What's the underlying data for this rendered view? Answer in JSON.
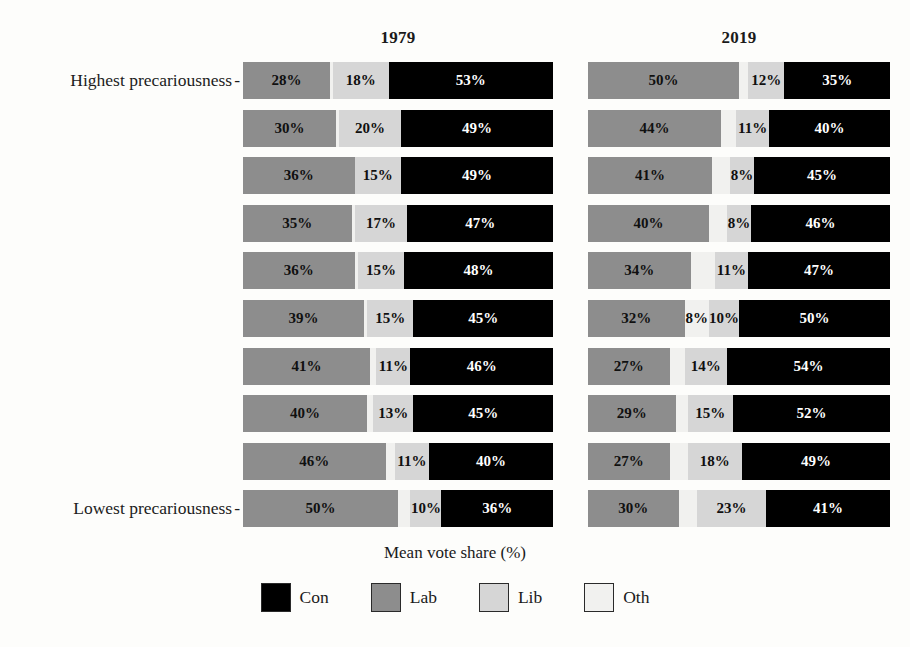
{
  "chart_data": {
    "type": "bar",
    "subtype": "stacked-horizontal",
    "title": "",
    "xlabel": "Mean vote share (%)",
    "ylabel": "",
    "xlim": [
      0,
      100
    ],
    "grid": false,
    "legend_position": "bottom",
    "panels": [
      {
        "label": "1979"
      },
      {
        "label": "2019"
      }
    ],
    "categories": [
      "Highest precariousness",
      "",
      "",
      "",
      "",
      "",
      "",
      "",
      "",
      "Lowest precariousness"
    ],
    "series_order": [
      "Lab",
      "Oth",
      "Lib",
      "Con"
    ],
    "legend": [
      {
        "name": "Con",
        "color": "#000000"
      },
      {
        "name": "Lab",
        "color": "#8d8d8d"
      },
      {
        "name": "Lib",
        "color": "#d6d6d6"
      },
      {
        "name": "Oth",
        "color": "#f1f1ef"
      }
    ],
    "panel_1979": {
      "rows": [
        {
          "Lab": 28,
          "Oth": 1,
          "Lib": 18,
          "Con": 53,
          "labels": {
            "Lab": "28%",
            "Oth": "",
            "Lib": "18%",
            "Con": "53%"
          }
        },
        {
          "Lab": 30,
          "Oth": 1,
          "Lib": 20,
          "Con": 49,
          "labels": {
            "Lab": "30%",
            "Oth": "",
            "Lib": "20%",
            "Con": "49%"
          }
        },
        {
          "Lab": 36,
          "Oth": 0,
          "Lib": 15,
          "Con": 49,
          "labels": {
            "Lab": "36%",
            "Oth": "",
            "Lib": "15%",
            "Con": "49%"
          }
        },
        {
          "Lab": 35,
          "Oth": 1,
          "Lib": 17,
          "Con": 47,
          "labels": {
            "Lab": "35%",
            "Oth": "",
            "Lib": "17%",
            "Con": "47%"
          }
        },
        {
          "Lab": 36,
          "Oth": 1,
          "Lib": 15,
          "Con": 48,
          "labels": {
            "Lab": "36%",
            "Oth": "",
            "Lib": "15%",
            "Con": "48%"
          }
        },
        {
          "Lab": 39,
          "Oth": 1,
          "Lib": 15,
          "Con": 45,
          "labels": {
            "Lab": "39%",
            "Oth": "",
            "Lib": "15%",
            "Con": "45%"
          }
        },
        {
          "Lab": 41,
          "Oth": 2,
          "Lib": 11,
          "Con": 46,
          "labels": {
            "Lab": "41%",
            "Oth": "",
            "Lib": "11%",
            "Con": "46%"
          }
        },
        {
          "Lab": 40,
          "Oth": 2,
          "Lib": 13,
          "Con": 45,
          "labels": {
            "Lab": "40%",
            "Oth": "",
            "Lib": "13%",
            "Con": "45%"
          }
        },
        {
          "Lab": 46,
          "Oth": 3,
          "Lib": 11,
          "Con": 40,
          "labels": {
            "Lab": "46%",
            "Oth": "",
            "Lib": "11%",
            "Con": "40%"
          }
        },
        {
          "Lab": 50,
          "Oth": 4,
          "Lib": 10,
          "Con": 36,
          "labels": {
            "Lab": "50%",
            "Oth": "",
            "Lib": "10%",
            "Con": "36%"
          }
        }
      ]
    },
    "panel_2019": {
      "rows": [
        {
          "Lab": 50,
          "Oth": 3,
          "Lib": 12,
          "Con": 35,
          "labels": {
            "Lab": "50%",
            "Oth": "",
            "Lib": "12%",
            "Con": "35%"
          }
        },
        {
          "Lab": 44,
          "Oth": 5,
          "Lib": 11,
          "Con": 40,
          "labels": {
            "Lab": "44%",
            "Oth": "",
            "Lib": "11%",
            "Con": "40%"
          }
        },
        {
          "Lab": 41,
          "Oth": 6,
          "Lib": 8,
          "Con": 45,
          "labels": {
            "Lab": "41%",
            "Oth": "",
            "Lib": "8%",
            "Con": "45%"
          }
        },
        {
          "Lab": 40,
          "Oth": 6,
          "Lib": 8,
          "Con": 46,
          "labels": {
            "Lab": "40%",
            "Oth": "",
            "Lib": "8%",
            "Con": "46%"
          }
        },
        {
          "Lab": 34,
          "Oth": 8,
          "Lib": 11,
          "Con": 47,
          "labels": {
            "Lab": "34%",
            "Oth": "",
            "Lib": "11%",
            "Con": "47%"
          }
        },
        {
          "Lab": 32,
          "Oth": 8,
          "Lib": 10,
          "Con": 50,
          "labels": {
            "Lab": "32%",
            "Oth": "8%",
            "Lib": "10%",
            "Con": "50%"
          }
        },
        {
          "Lab": 27,
          "Oth": 5,
          "Lib": 14,
          "Con": 54,
          "labels": {
            "Lab": "27%",
            "Oth": "",
            "Lib": "14%",
            "Con": "54%"
          }
        },
        {
          "Lab": 29,
          "Oth": 4,
          "Lib": 15,
          "Con": 52,
          "labels": {
            "Lab": "29%",
            "Oth": "",
            "Lib": "15%",
            "Con": "52%"
          }
        },
        {
          "Lab": 27,
          "Oth": 6,
          "Lib": 18,
          "Con": 49,
          "labels": {
            "Lab": "27%",
            "Oth": "",
            "Lib": "18%",
            "Con": "49%"
          }
        },
        {
          "Lab": 30,
          "Oth": 6,
          "Lib": 23,
          "Con": 41,
          "labels": {
            "Lab": "30%",
            "Oth": "",
            "Lib": "23%",
            "Con": "41%"
          }
        }
      ]
    }
  },
  "axis": {
    "x_label": "Mean vote share (%)",
    "y_top_label": "Highest precariousness",
    "y_bottom_label": "Lowest precariousness",
    "tick_dash": "-"
  },
  "panels": {
    "left_title": "1979",
    "right_title": "2019"
  },
  "legend": {
    "items": [
      {
        "label": "Con",
        "color": "#000000"
      },
      {
        "label": "Lab",
        "color": "#8d8d8d"
      },
      {
        "label": "Lib",
        "color": "#d6d6d6"
      },
      {
        "label": "Oth",
        "color": "#f1f1ef"
      }
    ]
  }
}
